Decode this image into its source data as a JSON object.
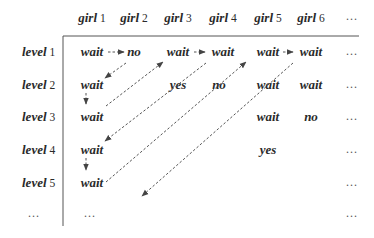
{
  "columns": [
    {
      "word": "girl",
      "num": "1",
      "x": 92
    },
    {
      "word": "girl",
      "num": "2",
      "x": 134
    },
    {
      "word": "girl",
      "num": "3",
      "x": 178
    },
    {
      "word": "girl",
      "num": "4",
      "x": 223
    },
    {
      "word": "girl",
      "num": "5",
      "x": 268
    },
    {
      "word": "girl",
      "num": "6",
      "x": 311
    },
    {
      "word": "...",
      "num": "",
      "x": 352
    }
  ],
  "rows": [
    {
      "word": "level",
      "num": "1",
      "y": 56
    },
    {
      "word": "level",
      "num": "2",
      "y": 89
    },
    {
      "word": "level",
      "num": "3",
      "y": 121
    },
    {
      "word": "level",
      "num": "4",
      "y": 154
    },
    {
      "word": "level",
      "num": "5",
      "y": 187
    },
    {
      "word": "...",
      "num": "",
      "y": 219
    }
  ],
  "cells": [
    {
      "row": 1,
      "col": 1,
      "text": "wait"
    },
    {
      "row": 1,
      "col": 2,
      "text": "no"
    },
    {
      "row": 1,
      "col": 3,
      "text": "wait"
    },
    {
      "row": 1,
      "col": 4,
      "text": "wait"
    },
    {
      "row": 1,
      "col": 5,
      "text": "wait"
    },
    {
      "row": 1,
      "col": 6,
      "text": "wait"
    },
    {
      "row": 1,
      "col": 7,
      "text": "..."
    },
    {
      "row": 2,
      "col": 1,
      "text": "wait"
    },
    {
      "row": 2,
      "col": 3,
      "text": "yes"
    },
    {
      "row": 2,
      "col": 4,
      "text": "no"
    },
    {
      "row": 2,
      "col": 5,
      "text": "wait"
    },
    {
      "row": 2,
      "col": 6,
      "text": "wait"
    },
    {
      "row": 2,
      "col": 7,
      "text": "..."
    },
    {
      "row": 3,
      "col": 1,
      "text": "wait"
    },
    {
      "row": 3,
      "col": 5,
      "text": "wait"
    },
    {
      "row": 3,
      "col": 6,
      "text": "no"
    },
    {
      "row": 3,
      "col": 7,
      "text": "..."
    },
    {
      "row": 4,
      "col": 1,
      "text": "wait"
    },
    {
      "row": 4,
      "col": 5,
      "text": "yes"
    },
    {
      "row": 4,
      "col": 7,
      "text": "..."
    },
    {
      "row": 5,
      "col": 1,
      "text": "wait"
    },
    {
      "row": 5,
      "col": 7,
      "text": "..."
    },
    {
      "row": 6,
      "col": 1,
      "text": "..."
    },
    {
      "row": 6,
      "col": 7,
      "text": "..."
    }
  ],
  "arrows": [
    {
      "from": "girl1-level1",
      "to": "girl2-level1",
      "direction": "right"
    },
    {
      "from": "girl2-level1",
      "to": "girl1-level2",
      "direction": "down-left"
    },
    {
      "from": "girl1-level2",
      "to": "girl1-level3",
      "direction": "down"
    },
    {
      "from": "girl1-level3",
      "to": "girl3-level1",
      "direction": "up-right"
    },
    {
      "from": "girl3-level1",
      "to": "girl4-level1",
      "direction": "right"
    },
    {
      "from": "girl4-level1",
      "to": "girl1-level4",
      "direction": "down-left"
    },
    {
      "from": "girl1-level4",
      "to": "girl1-level5",
      "direction": "down"
    },
    {
      "from": "girl1-level5",
      "to": "girl5-level1",
      "direction": "up-right"
    },
    {
      "from": "girl5-level1",
      "to": "girl6-level1",
      "direction": "right"
    },
    {
      "from": "girl6-level1",
      "to": "girl2-level5",
      "direction": "down-left"
    }
  ]
}
